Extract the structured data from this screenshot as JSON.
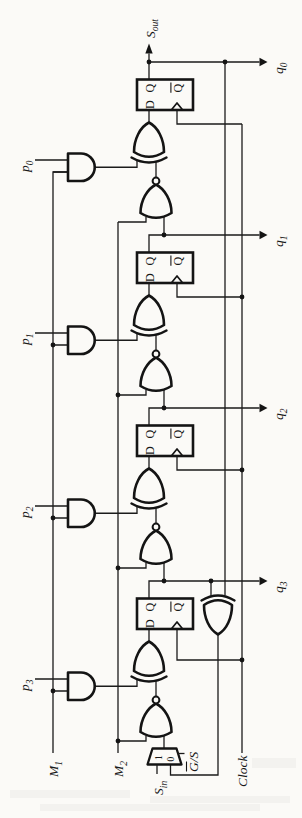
{
  "figure_labels": {
    "s_out": {
      "main": "S",
      "sub": "out"
    },
    "m1": {
      "main": "M",
      "sub": "1"
    },
    "m2": {
      "main": "M",
      "sub": "2"
    },
    "s_in": {
      "main": "S",
      "sub": "in"
    },
    "g_over_s": {
      "g": "G",
      "rest": "/S"
    },
    "clock": "Clock"
  },
  "stages": [
    {
      "p": {
        "main": "p",
        "sub": "0"
      },
      "q": {
        "main": "q",
        "sub": "0"
      }
    },
    {
      "p": {
        "main": "p",
        "sub": "1"
      },
      "q": {
        "main": "q",
        "sub": "1"
      }
    },
    {
      "p": {
        "main": "p",
        "sub": "2"
      },
      "q": {
        "main": "q",
        "sub": "2"
      }
    },
    {
      "p": {
        "main": "p",
        "sub": "3"
      },
      "q": {
        "main": "q",
        "sub": "3"
      }
    }
  ],
  "flip_flop_pins": {
    "d": "D",
    "q": "Q",
    "q_bar": "Q"
  },
  "mux_pins": {
    "one": "1",
    "zero": "0"
  },
  "colors": {
    "ink": "#1b1b1b",
    "paper": "#fbfaf7"
  }
}
